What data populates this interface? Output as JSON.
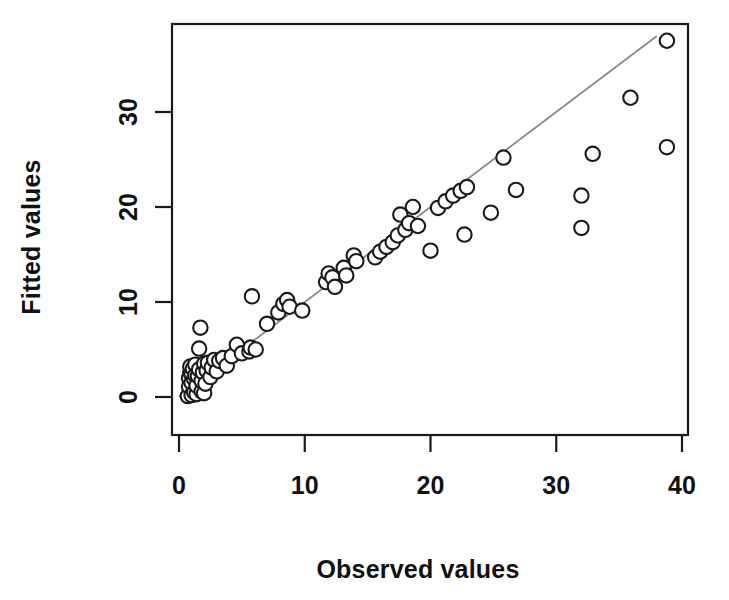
{
  "chart_data": {
    "type": "scatter",
    "title": "",
    "xlabel": "Observed values",
    "ylabel": "Fitted values",
    "xlim": [
      0,
      40
    ],
    "ylim": [
      0,
      39.5
    ],
    "xticks": [
      0,
      10,
      20,
      30,
      40
    ],
    "yticks": [
      0,
      10,
      20,
      30
    ],
    "xtick_labels": [
      "0",
      "10",
      "20",
      "30",
      "40"
    ],
    "ytick_labels": [
      "0",
      "10",
      "20",
      "30"
    ],
    "grid": false,
    "legend": null,
    "marker": "open-circle",
    "marker_color": "#1b1b1b",
    "marker_fill": "#ffffff",
    "reference_line": {
      "name": "identity-line",
      "type": "line",
      "slope": 1.0,
      "intercept": 0.0,
      "color": "#8a8a8a",
      "x_from": 0,
      "x_to": 38.0
    },
    "points": [
      [
        0.7,
        0.1
      ],
      [
        0.8,
        1.1
      ],
      [
        0.8,
        2.0
      ],
      [
        0.9,
        2.6
      ],
      [
        0.9,
        3.2
      ],
      [
        1.0,
        0.2
      ],
      [
        1.0,
        1.5
      ],
      [
        1.0,
        2.4
      ],
      [
        1.1,
        3.0
      ],
      [
        1.2,
        0.5
      ],
      [
        1.2,
        1.9
      ],
      [
        1.3,
        2.3
      ],
      [
        1.3,
        3.4
      ],
      [
        1.4,
        0.3
      ],
      [
        1.4,
        1.2
      ],
      [
        1.5,
        2.2
      ],
      [
        1.6,
        2.9
      ],
      [
        1.6,
        5.1
      ],
      [
        1.7,
        7.3
      ],
      [
        1.8,
        0.6
      ],
      [
        1.8,
        1.7
      ],
      [
        1.9,
        2.6
      ],
      [
        2.0,
        3.5
      ],
      [
        2.0,
        0.4
      ],
      [
        2.1,
        1.4
      ],
      [
        2.2,
        2.8
      ],
      [
        2.3,
        3.6
      ],
      [
        2.5,
        2.1
      ],
      [
        2.6,
        3.1
      ],
      [
        2.8,
        3.9
      ],
      [
        3.0,
        2.7
      ],
      [
        3.2,
        3.8
      ],
      [
        3.5,
        4.1
      ],
      [
        3.8,
        3.3
      ],
      [
        4.2,
        4.3
      ],
      [
        4.6,
        5.5
      ],
      [
        5.0,
        4.6
      ],
      [
        5.6,
        4.8
      ],
      [
        5.7,
        5.2
      ],
      [
        5.8,
        10.6
      ],
      [
        6.1,
        5.0
      ],
      [
        7.0,
        7.7
      ],
      [
        7.9,
        8.9
      ],
      [
        8.3,
        9.8
      ],
      [
        8.6,
        10.2
      ],
      [
        8.8,
        9.5
      ],
      [
        9.8,
        9.1
      ],
      [
        11.7,
        12.1
      ],
      [
        11.9,
        13.0
      ],
      [
        12.2,
        12.6
      ],
      [
        12.4,
        11.6
      ],
      [
        13.1,
        13.6
      ],
      [
        13.3,
        12.8
      ],
      [
        13.9,
        14.9
      ],
      [
        14.1,
        14.3
      ],
      [
        15.6,
        14.7
      ],
      [
        16.0,
        15.3
      ],
      [
        16.5,
        15.8
      ],
      [
        17.0,
        16.3
      ],
      [
        17.4,
        17.0
      ],
      [
        17.6,
        19.2
      ],
      [
        18.0,
        17.6
      ],
      [
        18.3,
        18.3
      ],
      [
        18.6,
        20.0
      ],
      [
        19.0,
        18.0
      ],
      [
        20.0,
        15.4
      ],
      [
        20.6,
        19.9
      ],
      [
        21.2,
        20.6
      ],
      [
        21.8,
        21.2
      ],
      [
        22.4,
        21.7
      ],
      [
        22.9,
        22.1
      ],
      [
        22.7,
        17.1
      ],
      [
        24.8,
        19.4
      ],
      [
        25.8,
        25.2
      ],
      [
        26.8,
        21.8
      ],
      [
        32.0,
        17.8
      ],
      [
        32.0,
        21.2
      ],
      [
        32.9,
        25.6
      ],
      [
        35.9,
        31.5
      ],
      [
        38.8,
        26.3
      ],
      [
        38.8,
        37.5
      ]
    ]
  },
  "axes": {
    "x_axis": {
      "label": "Observed values",
      "ticks": [
        "0",
        "10",
        "20",
        "30",
        "40"
      ]
    },
    "y_axis": {
      "label": "Fitted values",
      "ticks": [
        "0",
        "10",
        "20",
        "30"
      ]
    }
  }
}
